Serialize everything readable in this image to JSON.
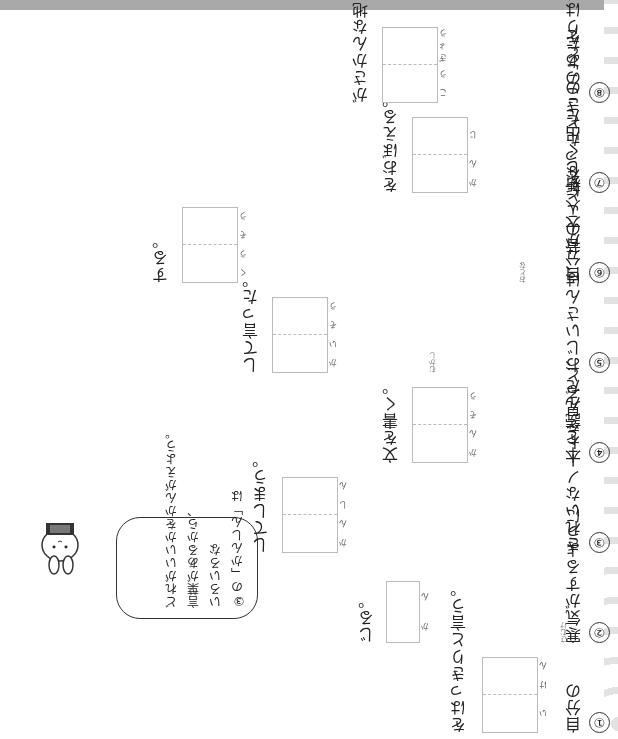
{
  "worksheet": {
    "orientation": "rotated 180 degrees",
    "items": [
      {
        "number": "①",
        "before": "自分の",
        "answer_reading": [
          "い",
          "け",
          "ん"
        ],
        "after": "をはっきりと言う。",
        "box_cells": 2
      },
      {
        "number": "②",
        "before": "寒気がするように",
        "ruby": [
          {
            "kanji": "寒気",
            "reading": "さむけ"
          }
        ],
        "answer_reading": [
          "か",
          "ん"
        ],
        "after": "じる。",
        "box_cells": 1
      },
      {
        "number": "③",
        "before": "きれいなノートを見ると、",
        "answer_reading": [
          "か",
          "ん",
          "し",
          "ん"
        ],
        "after": "してしまう。",
        "box_cells": 2
      },
      {
        "number": "④",
        "before": "本を読んだ",
        "answer_reading": [
          "か",
          "ん",
          "そ",
          "う"
        ],
        "after": "文を書く。",
        "box_cells": 2
      },
      {
        "number": "⑤",
        "before": "おじいさんは、昔のことを",
        "ruby": [
          {
            "kanji": "昔",
            "reading": "むかし"
          }
        ],
        "answer_reading": [
          "か",
          "い",
          "そ",
          "う"
        ],
        "after": "して言った。",
        "box_cells": 2
      },
      {
        "number": "⑥",
        "before": "自分が大人になったときのことを",
        "ruby": [
          {
            "kanji": "大人",
            "reading": "おとな"
          }
        ],
        "answer_reading": [
          "く",
          "う",
          "そ",
          "う"
        ],
        "after": "する。",
        "box_cells": 2
      },
      {
        "number": "⑦",
        "before": "新しく出た",
        "answer_reading": [
          "か",
          "ん",
          "じ"
        ],
        "after": "をおぼえる。",
        "box_cells": 2
      },
      {
        "number": "⑧",
        "before": "このあたりは、",
        "answer_reading": [
          "こ",
          "う",
          "ぎ",
          "ょ",
          "う"
        ],
        "after": "がさかんな地いきだ。",
        "box_cells": 2
      }
    ],
    "hint_bubble": {
      "lines": [
        "③の「かんしん」は",
        "いろいろな",
        "言葉があるから、",
        "どれがいいかをかんがえよう。"
      ],
      "ruby": [
        {
          "kanji": "言葉",
          "reading": "ことば"
        }
      ]
    },
    "mascot": {
      "icon": "rabbit-character-icon"
    }
  }
}
